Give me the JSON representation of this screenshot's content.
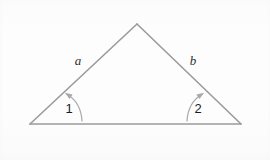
{
  "figure": {
    "kind": "geometry-diagram",
    "canvas": {
      "width": 270,
      "height": 160
    },
    "background_color": "#fdfdfd",
    "line_color": "#9b9b9b",
    "arc_color": "#a9a9a9",
    "side_label_color": "#2f2f2f",
    "angle_label_color": "#1c1c1c"
  },
  "triangle": {
    "name": "triangle",
    "vertices": {
      "apex": {
        "label": "",
        "x": 137,
        "y": 24
      },
      "left": {
        "label": "",
        "x": 30,
        "y": 124
      },
      "right": {
        "label": "",
        "x": 241,
        "y": 124
      }
    },
    "edges": [
      {
        "name": "left-leg",
        "from": "left",
        "to": "apex"
      },
      {
        "name": "right-leg",
        "from": "apex",
        "to": "right"
      },
      {
        "name": "base",
        "from": "left",
        "to": "right"
      }
    ]
  },
  "side_labels": [
    {
      "name": "side-label-a",
      "text": "a",
      "x": 78,
      "y": 62
    },
    {
      "name": "side-label-b",
      "text": "b",
      "x": 193,
      "y": 62
    }
  ],
  "angle_markers": [
    {
      "name": "angle-marker-1",
      "text": "1",
      "label_x": 69,
      "label_y": 110,
      "vertex": "left",
      "arc_path": "M 82 121 Q 81 103 67.5 94.5",
      "arrow_points": "64.8,92.8 72.6,94.4 69.6,99.0"
    },
    {
      "name": "angle-marker-2",
      "text": "2",
      "label_x": 198,
      "label_y": 110,
      "vertex": "right",
      "arc_path": "M 187 121 Q 188 103 201.5 94.5",
      "arrow_points": "204.2,92.8 196.4,94.4 199.4,99.0"
    }
  ]
}
